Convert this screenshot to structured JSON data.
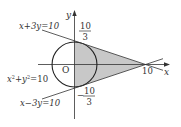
{
  "diagram": {
    "type": "coordinate-geometry",
    "origin_label": "O",
    "x_axis_label": "x",
    "y_axis_label": "y",
    "circle": {
      "equation": "x²+y²=10",
      "label_x": "x",
      "label_plus": "+",
      "label_y": "y",
      "label_eq": "=10",
      "radius_sq": 10
    },
    "line_upper": {
      "equation": "x+3y=10",
      "label": "x+3y=10"
    },
    "line_lower": {
      "equation": "x−3y=10",
      "label": "x−3y=10"
    },
    "y_intercept_upper": {
      "num": "10",
      "den": "3"
    },
    "y_intercept_lower": {
      "sign": "−",
      "num": "10",
      "den": "3"
    },
    "x_intercept": "10",
    "shaded_region": {
      "vertices": [
        [
          0,
          3.333
        ],
        [
          0,
          -3.333
        ],
        [
          10,
          0
        ]
      ],
      "color": "#c8c8c8"
    },
    "colors": {
      "stroke": "#222222",
      "shade": "#c8c8c8",
      "text": "#333333"
    }
  }
}
